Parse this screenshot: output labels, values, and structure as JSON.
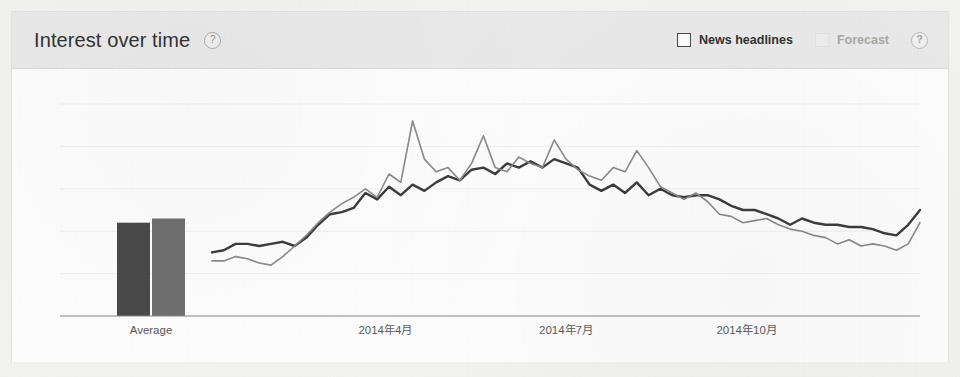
{
  "panel": {
    "title": "Interest over time",
    "title_help_icon": "help-circle-icon",
    "controls": [
      {
        "label": "News headlines",
        "checked": false,
        "disabled": false,
        "icon": "checkbox-icon"
      },
      {
        "label": "Forecast",
        "checked": false,
        "disabled": true,
        "icon": "checkbox-icon",
        "help_icon": "help-circle-icon"
      }
    ]
  },
  "chart_data": {
    "type": "line",
    "title": "Interest over time",
    "xlabel": "",
    "ylabel": "",
    "ylim": [
      0,
      100
    ],
    "grid": true,
    "legend": "none",
    "average_label": "Average",
    "average_bars": [
      {
        "name": "Series 1",
        "value": 44,
        "color": "#4a4a4a"
      },
      {
        "name": "Series 2",
        "value": 46,
        "color": "#707070"
      }
    ],
    "tick_labels": [
      "2014年4月",
      "2014年7月",
      "2014年10月"
    ],
    "tick_positions": [
      0.2449,
      0.5,
      0.7551
    ],
    "series": [
      {
        "name": "Series 1",
        "color": "#3c3c3c",
        "width": 2.4,
        "values": [
          30,
          31,
          34,
          34,
          33,
          34,
          35,
          33,
          37,
          43,
          48,
          49,
          51,
          58,
          55,
          61,
          57,
          62,
          59,
          63,
          66,
          64,
          69,
          70,
          67,
          72,
          70,
          73,
          70,
          74,
          72,
          70,
          62,
          59,
          62,
          58,
          63,
          57,
          60,
          57,
          56,
          57,
          57,
          55,
          52,
          50,
          50,
          48,
          46,
          43,
          46,
          44,
          43,
          43,
          42,
          42,
          41,
          39,
          38,
          43,
          50
        ]
      },
      {
        "name": "Series 2",
        "color": "#8a8a8a",
        "width": 1.6,
        "values": [
          26,
          26,
          28,
          27,
          25,
          24,
          28,
          33,
          38,
          44,
          49,
          53,
          56,
          60,
          56,
          67,
          63,
          92,
          74,
          68,
          70,
          64,
          72,
          85,
          70,
          68,
          75,
          72,
          70,
          83,
          74,
          69,
          66,
          64,
          70,
          68,
          78,
          70,
          61,
          58,
          55,
          58,
          54,
          48,
          47,
          44,
          45,
          46,
          43,
          41,
          40,
          38,
          37,
          34,
          36,
          33,
          34,
          33,
          31,
          34,
          44
        ]
      }
    ]
  }
}
